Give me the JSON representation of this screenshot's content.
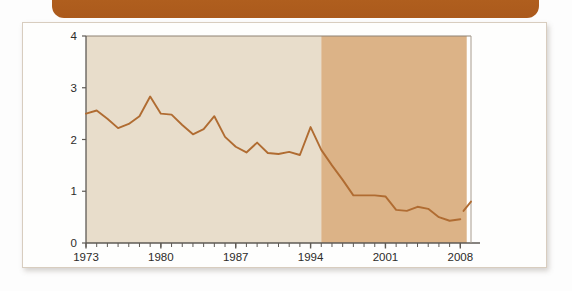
{
  "banner": {
    "name": "top-banner",
    "color": "#ab5a1c",
    "label": ""
  },
  "card": {
    "background": "#fefefd",
    "border_color": "#d8cdbf"
  },
  "chart_data": {
    "type": "line",
    "title": "",
    "subtitle": "",
    "xlabel": "",
    "ylabel": "",
    "xlim": [
      1973,
      2009
    ],
    "ylim": [
      0,
      4
    ],
    "grid": false,
    "legend": "none",
    "line_color": "#b06c32",
    "tick_label_color": "#2c2b29",
    "axis_color": "#5e5a55",
    "bands": [
      {
        "name": "historical",
        "from": 1973,
        "to": 1995,
        "color": "#e8ddcb"
      },
      {
        "name": "projected",
        "from": 1995,
        "to": 2008.6,
        "color": "#dcb387"
      }
    ],
    "x_tick_labels": [
      "1973",
      "1980",
      "1987",
      "1994",
      "2001",
      "2008"
    ],
    "x_tick_values": [
      1973,
      1980,
      1987,
      1994,
      2001,
      2008
    ],
    "x_minor_step": 1,
    "y_tick_labels": [
      "0",
      "1",
      "2",
      "3",
      "4"
    ],
    "y_tick_values": [
      0,
      1,
      2,
      3,
      4
    ],
    "x": [
      1973,
      1974,
      1975,
      1976,
      1977,
      1978,
      1979,
      1980,
      1981,
      1982,
      1983,
      1984,
      1985,
      1986,
      1987,
      1988,
      1989,
      1990,
      1991,
      1992,
      1993,
      1994,
      1995,
      1996,
      1997,
      1998,
      1999,
      2000,
      2001,
      2002,
      2003,
      2004,
      2005,
      2006,
      2007,
      2008
    ],
    "values": [
      2.5,
      2.56,
      2.4,
      2.22,
      2.3,
      2.45,
      2.83,
      2.5,
      2.48,
      2.28,
      2.1,
      2.2,
      2.45,
      2.05,
      1.86,
      1.75,
      1.94,
      1.74,
      1.72,
      1.76,
      1.7,
      2.24,
      1.8,
      1.5,
      1.22,
      0.92,
      0.92,
      0.92,
      0.9,
      0.64,
      0.62,
      0.7,
      0.66,
      0.5,
      0.43,
      0.46
    ],
    "tail_segment": {
      "name": "post-axis-rise",
      "x": [
        2008.3,
        2009
      ],
      "values": [
        0.62,
        0.8
      ]
    }
  }
}
